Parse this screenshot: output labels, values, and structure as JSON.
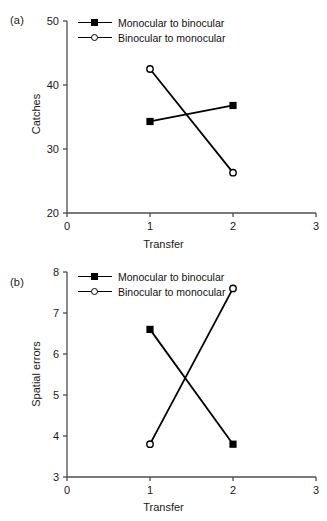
{
  "figure": {
    "panels": [
      {
        "label": "(a)",
        "xlabel": "Transfer",
        "ylabel": "Catches"
      },
      {
        "label": "(b)",
        "xlabel": "Transfer",
        "ylabel": "Spatial errors"
      }
    ]
  },
  "chart_data": [
    {
      "type": "line",
      "title": "",
      "panel": "(a)",
      "xlabel": "Transfer",
      "ylabel": "Catches",
      "x": [
        1,
        2
      ],
      "xlim": [
        0,
        3
      ],
      "ylim": [
        20,
        50
      ],
      "xticks": [
        0,
        1,
        2,
        3
      ],
      "yticks": [
        20,
        30,
        40,
        50
      ],
      "xticklabels": [
        "0",
        "1",
        "2",
        "3"
      ],
      "yticklabels": [
        "20",
        "30",
        "40",
        "50"
      ],
      "grid": false,
      "legend_position": "top-center",
      "series": [
        {
          "name": "Monocular to binocular",
          "marker": "filled-square",
          "values": [
            34.3,
            36.8
          ]
        },
        {
          "name": "Binocular to monocular",
          "marker": "open-circle",
          "values": [
            42.5,
            26.3
          ]
        }
      ]
    },
    {
      "type": "line",
      "title": "",
      "panel": "(b)",
      "xlabel": "Transfer",
      "ylabel": "Spatial errors",
      "x": [
        1,
        2
      ],
      "xlim": [
        0,
        3
      ],
      "ylim": [
        3,
        8
      ],
      "xticks": [
        0,
        1,
        2,
        3
      ],
      "yticks": [
        3,
        4,
        5,
        6,
        7,
        8
      ],
      "xticklabels": [
        "0",
        "1",
        "2",
        "3"
      ],
      "yticklabels": [
        "3",
        "4",
        "5",
        "6",
        "7",
        "8"
      ],
      "grid": false,
      "legend_position": "top-center",
      "series": [
        {
          "name": "Monocular to binocular",
          "marker": "filled-square",
          "values": [
            6.6,
            3.8
          ]
        },
        {
          "name": "Binocular to monocular",
          "marker": "open-circle",
          "values": [
            3.8,
            7.6
          ]
        }
      ]
    }
  ]
}
